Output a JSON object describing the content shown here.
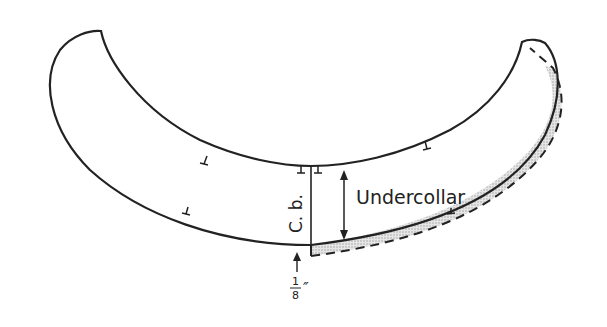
{
  "diagram": {
    "type": "sewing-pattern",
    "piece_label": "Undercollar",
    "center_back_label": "C. b.",
    "allowance_label": "1/8″",
    "allowance_numerator": "1",
    "allowance_denominator": "8",
    "allowance_unit": "″",
    "colors": {
      "line": "#222222",
      "shading": "#c8c8c8",
      "background": "#ffffff"
    },
    "elements": [
      {
        "name": "undercollar-outline",
        "style": "solid"
      },
      {
        "name": "center-back-line",
        "style": "solid"
      },
      {
        "name": "width-arrow",
        "style": "double-headed"
      },
      {
        "name": "allowance-dashed-line",
        "style": "dashed"
      },
      {
        "name": "allowance-shaded-area",
        "style": "stippled"
      },
      {
        "name": "notch-marks",
        "count": 6
      }
    ]
  }
}
